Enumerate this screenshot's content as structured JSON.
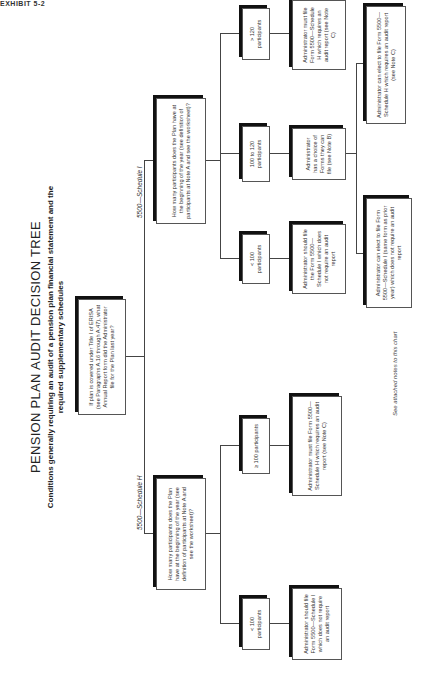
{
  "page_label": "EXHIBIT 5-2",
  "title": "PENSION PLAN AUDIT DECISION TREE",
  "subtitle": "Conditions generally requiring an audit of a pension plan financial statement and the required supplementary schedules",
  "root": {
    "question": "If plan is covered under Title I of ERISA (see Paragraphs A.16 through A.47), what Annual Report form did the Administrator file for the Plan last year?"
  },
  "branches": [
    {
      "label": "5500—Schedule H",
      "question": "How many participants does the Plan have at the beginning of the year (see definition of participants at Note A and see the worksheet)?",
      "options": [
        {
          "label": "< 100 participants",
          "outcome": "Administrator should file Form 5500—Schedule I which does not require an audit report"
        },
        {
          "label": "≥ 100 participants",
          "outcome": "Administrator must file Form 5500—Schedule H which requires an audit report (see Note C)"
        }
      ]
    },
    {
      "label": "5500—Schedule I",
      "question": "How many participants does the Plan have at the beginning of the year (see definition of participants at Note A and see the worksheet)?",
      "options": [
        {
          "label": "< 100 participants",
          "outcome": "Administrator should file the Form 5500—Schedule I which does not require an audit report"
        },
        {
          "label": "100 to 120 participants",
          "outcome": "Administrator has a choice of Forms they can file (see Note B)",
          "sub_outcomes": [
            "Administrator can elect to file Form 5500—Schedule I (same form as prior year) which does not require an audit report",
            "Administrator can elect to file Form 5500—Schedule H which requires an audit report (see Note C)"
          ]
        },
        {
          "label": "> 120 participants",
          "outcome": "Administrator must file Form 5500—Schedule H which requires an audit report (see Note C)"
        }
      ]
    }
  ],
  "footnote": "See attached notes to this chart"
}
